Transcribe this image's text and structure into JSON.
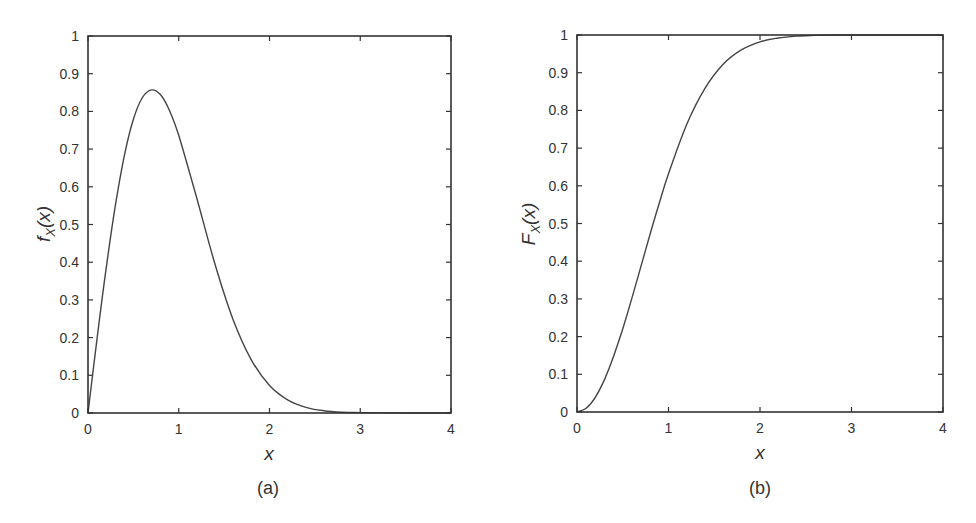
{
  "chart_data": [
    {
      "type": "line",
      "panel": "(a)",
      "title": "",
      "xlabel": "x",
      "ylabel": "f_X(x)",
      "xlim": [
        0,
        4
      ],
      "ylim": [
        0,
        1
      ],
      "xticks": [
        "0",
        "1",
        "2",
        "3",
        "4"
      ],
      "yticks": [
        "0",
        "0.1",
        "0.2",
        "0.3",
        "0.4",
        "0.5",
        "0.6",
        "0.7",
        "0.8",
        "0.9",
        "1"
      ],
      "grid": false,
      "legend": null,
      "series": [
        {
          "name": "f_X(x)",
          "x": [
            0,
            0.1,
            0.2,
            0.3,
            0.4,
            0.5,
            0.6,
            0.7,
            0.8,
            0.9,
            1.0,
            1.2,
            1.4,
            1.6,
            1.8,
            2.0,
            2.2,
            2.4,
            2.6,
            2.8,
            3.0,
            3.5,
            4.0
          ],
          "values": [
            0,
            0.198,
            0.384,
            0.548,
            0.682,
            0.779,
            0.837,
            0.857,
            0.844,
            0.801,
            0.736,
            0.569,
            0.394,
            0.247,
            0.141,
            0.073,
            0.035,
            0.015,
            0.006,
            0.002,
            0.001,
            0.0,
            0.0
          ]
        }
      ],
      "caption": "(a)"
    },
    {
      "type": "line",
      "panel": "(b)",
      "title": "",
      "xlabel": "x",
      "ylabel": "F_X(x)",
      "xlim": [
        0,
        4
      ],
      "ylim": [
        0,
        1
      ],
      "xticks": [
        "0",
        "1",
        "2",
        "3",
        "4"
      ],
      "yticks": [
        "0",
        "0.1",
        "0.2",
        "0.3",
        "0.4",
        "0.5",
        "0.6",
        "0.7",
        "0.8",
        "0.9",
        "1"
      ],
      "grid": false,
      "legend": null,
      "series": [
        {
          "name": "F_X(x)",
          "x": [
            0,
            0.1,
            0.2,
            0.3,
            0.4,
            0.5,
            0.6,
            0.7,
            0.8,
            0.9,
            1.0,
            1.2,
            1.4,
            1.6,
            1.8,
            2.0,
            2.2,
            2.4,
            2.6,
            2.8,
            3.0,
            3.5,
            4.0
          ],
          "values": [
            0,
            0.01,
            0.039,
            0.086,
            0.148,
            0.221,
            0.302,
            0.387,
            0.473,
            0.555,
            0.632,
            0.763,
            0.859,
            0.923,
            0.961,
            0.982,
            0.992,
            0.997,
            0.999,
            1.0,
            1.0,
            1.0,
            1.0
          ]
        }
      ],
      "caption": "(b)"
    }
  ],
  "panels": {
    "a": {
      "ylabel_main": "f",
      "ylabel_sub": "X",
      "ylabel_arg": "(x)",
      "xlabel": "x",
      "caption": "(a)"
    },
    "b": {
      "ylabel_main": "F",
      "ylabel_sub": "X",
      "ylabel_arg": "(x)",
      "xlabel": "x",
      "caption": "(b)"
    }
  },
  "style": {
    "line_color": "#444444",
    "frame_color": "#333333",
    "background": "#ffffff"
  }
}
